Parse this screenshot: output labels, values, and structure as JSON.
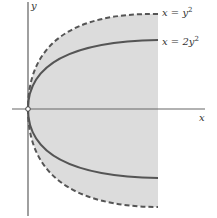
{
  "figure": {
    "axes": {
      "x_label": "x",
      "y_label": "y"
    },
    "curves": [
      {
        "id": "outer",
        "label": "x = y²",
        "label_x": "x = y",
        "label_sup": "2",
        "style": "dashed",
        "a": 1
      },
      {
        "id": "inner",
        "label": "x = 2y²",
        "label_x": "x = 2y",
        "label_sup": "2",
        "style": "solid",
        "a": 2
      }
    ],
    "region": {
      "description": "Shaded region between y-axis side of x = y² parabola, bounded on right by vertical line",
      "fill": "#d9d9d9"
    },
    "origin_marker": "open-circle",
    "colors": {
      "curve": "#555555",
      "axis": "#777777",
      "shade": "#dcdcdc"
    }
  }
}
